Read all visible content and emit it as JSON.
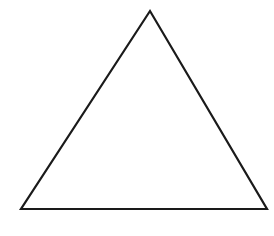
{
  "figure": {
    "shape": "triangle",
    "type": "equilateral-like outline",
    "vertices": {
      "apex": [
        150,
        11
      ],
      "bottom_left": [
        21,
        209
      ],
      "bottom_right": [
        267,
        209
      ]
    },
    "stroke_color": "#1a1a1a",
    "fill_color": "#ffffff",
    "stroke_width": 2.2,
    "labels": []
  }
}
